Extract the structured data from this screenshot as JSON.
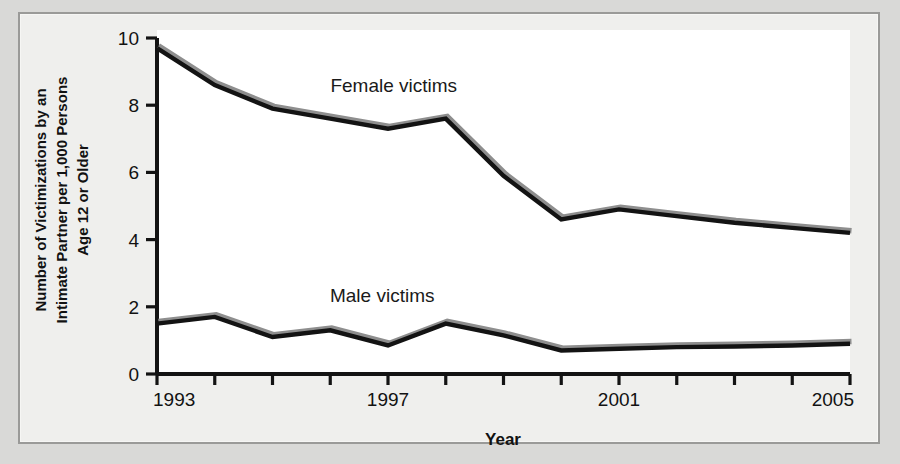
{
  "chart_data": {
    "type": "line",
    "title": "",
    "xlabel": "Year",
    "ylabel": "Number of Victimizations by an Intimate Partner per 1,000 Persons Age 12 or Older",
    "ylabel_lines": [
      "Number of Victimizations by an",
      "Intimate Partner per 1,000 Persons",
      "Age 12 or Older"
    ],
    "x": [
      1993,
      1994,
      1995,
      1996,
      1997,
      1998,
      1999,
      2000,
      2001,
      2002,
      2003,
      2004,
      2005
    ],
    "xlim": [
      1993,
      2005
    ],
    "ylim": [
      0,
      10
    ],
    "ytick_labels": [
      "0",
      "2",
      "4",
      "6",
      "8",
      "10"
    ],
    "ytick_values": [
      0,
      2,
      4,
      6,
      8,
      10
    ],
    "xtick_labels": [
      "1993",
      "",
      "",
      "",
      "1997",
      "",
      "",
      "",
      "2001",
      "",
      "",
      "",
      "2005"
    ],
    "xtick_values": [
      1993,
      1994,
      1995,
      1996,
      1997,
      1998,
      1999,
      2000,
      2001,
      2002,
      2003,
      2004,
      2005
    ],
    "grid": false,
    "legend_position": "inline-annotation",
    "series": [
      {
        "name": "Female victims",
        "label": "Female victims",
        "color": "#131313",
        "shadow_color": "#8e8e8e",
        "values": [
          9.7,
          8.6,
          7.9,
          7.6,
          7.3,
          7.6,
          5.9,
          4.6,
          4.9,
          4.7,
          4.5,
          4.35,
          4.2
        ]
      },
      {
        "name": "Male victims",
        "label": "Male victims",
        "color": "#131313",
        "shadow_color": "#8e8e8e",
        "values": [
          1.5,
          1.7,
          1.1,
          1.3,
          0.85,
          1.5,
          1.15,
          0.7,
          0.75,
          0.8,
          0.82,
          0.85,
          0.9
        ]
      }
    ],
    "annotations": [
      {
        "text": "Female victims",
        "x": 1997.1,
        "y": 8.4
      },
      {
        "text": "Male victims",
        "x": 1996.9,
        "y": 2.15
      }
    ]
  },
  "colors": {
    "page_background": "#d9d9d7",
    "panel_background": "#efefed",
    "panel_border": "#9a9a98",
    "plot_background": "#ffffff",
    "axis": "#131313",
    "text": "#121212"
  }
}
